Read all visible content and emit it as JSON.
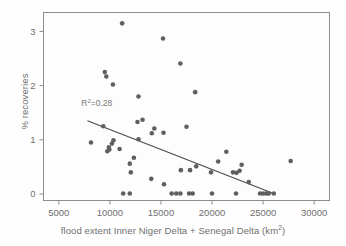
{
  "chart_data": {
    "type": "scatter",
    "title": "",
    "xlabel": "flood extent Inner Niger Delta + Senegal Delta (km2)",
    "xlabel_prefix": "flood extent Inner Niger Delta + Senegal Delta (km",
    "xlabel_superscript": "2",
    "xlabel_suffix": ")",
    "ylabel": "% recoveries",
    "xlim": [
      3500,
      31500
    ],
    "ylim": [
      -0.12,
      3.35
    ],
    "xticks": [
      5000,
      10000,
      15000,
      20000,
      25000,
      30000
    ],
    "xtick_labels": [
      "5000",
      "10000",
      "15000",
      "20000",
      "25000",
      "30000"
    ],
    "yticks": [
      0,
      1,
      2,
      3
    ],
    "ytick_labels": [
      "0",
      "1",
      "2",
      "3"
    ],
    "grid": false,
    "legend": null,
    "annotations": [
      {
        "name": "r-squared-label",
        "text": "R2=0.28",
        "text_prefix": "R",
        "text_superscript": "2",
        "text_suffix": "=0.28",
        "x": 7200,
        "y": 1.62
      }
    ],
    "trendline": {
      "name": "regression-line",
      "x_start": 7800,
      "y_start": 1.35,
      "x_end": 25900,
      "y_end": 0.02,
      "r_squared": 0.28,
      "color": "#4a4a4a"
    },
    "marker": {
      "shape": "circle",
      "color": "#5f5f5f",
      "size": 4.6
    },
    "points": [
      {
        "x": 11200,
        "y": 3.15
      },
      {
        "x": 15200,
        "y": 2.87
      },
      {
        "x": 16900,
        "y": 2.41
      },
      {
        "x": 9500,
        "y": 2.25
      },
      {
        "x": 9650,
        "y": 2.17
      },
      {
        "x": 10300,
        "y": 2.02
      },
      {
        "x": 18350,
        "y": 1.88
      },
      {
        "x": 12800,
        "y": 1.8
      },
      {
        "x": 12700,
        "y": 1.33
      },
      {
        "x": 13200,
        "y": 1.37
      },
      {
        "x": 17500,
        "y": 1.24
      },
      {
        "x": 14350,
        "y": 1.21
      },
      {
        "x": 15250,
        "y": 1.13
      },
      {
        "x": 14100,
        "y": 1.12
      },
      {
        "x": 9350,
        "y": 1.25
      },
      {
        "x": 12800,
        "y": 1.01
      },
      {
        "x": 10350,
        "y": 0.99
      },
      {
        "x": 8150,
        "y": 0.95
      },
      {
        "x": 10200,
        "y": 0.93
      },
      {
        "x": 9900,
        "y": 0.86
      },
      {
        "x": 9950,
        "y": 0.82
      },
      {
        "x": 9750,
        "y": 0.79
      },
      {
        "x": 10950,
        "y": 0.83
      },
      {
        "x": 21400,
        "y": 0.78
      },
      {
        "x": 12350,
        "y": 0.67
      },
      {
        "x": 20600,
        "y": 0.6
      },
      {
        "x": 27700,
        "y": 0.61
      },
      {
        "x": 11950,
        "y": 0.56
      },
      {
        "x": 22900,
        "y": 0.54
      },
      {
        "x": 18450,
        "y": 0.51
      },
      {
        "x": 17850,
        "y": 0.44
      },
      {
        "x": 16950,
        "y": 0.44
      },
      {
        "x": 22700,
        "y": 0.43
      },
      {
        "x": 22050,
        "y": 0.4
      },
      {
        "x": 22400,
        "y": 0.39
      },
      {
        "x": 19900,
        "y": 0.4
      },
      {
        "x": 12050,
        "y": 0.4
      },
      {
        "x": 14050,
        "y": 0.28
      },
      {
        "x": 23600,
        "y": 0.22
      },
      {
        "x": 15300,
        "y": 0.18
      },
      {
        "x": 11300,
        "y": 0.01
      },
      {
        "x": 11950,
        "y": 0.01
      },
      {
        "x": 16050,
        "y": 0.01
      },
      {
        "x": 16500,
        "y": 0.01
      },
      {
        "x": 16900,
        "y": 0.01
      },
      {
        "x": 17750,
        "y": 0.01
      },
      {
        "x": 18100,
        "y": 0.01
      },
      {
        "x": 20000,
        "y": 0.01
      },
      {
        "x": 22350,
        "y": 0.01
      },
      {
        "x": 24700,
        "y": 0.01
      },
      {
        "x": 25000,
        "y": 0.01
      },
      {
        "x": 25300,
        "y": 0.01
      },
      {
        "x": 25550,
        "y": 0.01
      },
      {
        "x": 26050,
        "y": 0.01
      }
    ]
  },
  "frame": {
    "border_color": "#8d8d8d",
    "plot_background": "#fdfdfd"
  }
}
